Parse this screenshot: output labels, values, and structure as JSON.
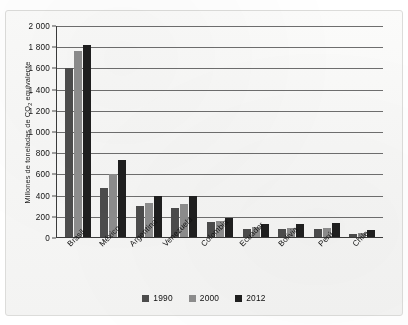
{
  "chart_data": {
    "type": "bar",
    "title": "",
    "subtitle": "",
    "xlabel": "",
    "ylabel": "Millones de toneladas de CO2 equivalente",
    "ylabel_parts": {
      "before": "Millones de toneladas de CO",
      "subscript": "2",
      "after": " equivalente"
    },
    "categories": [
      "Brasil",
      "México",
      "Argentina",
      "Venezuela",
      "Colombia",
      "Ecuador",
      "Bolivia",
      "Perú",
      "Chile"
    ],
    "series": [
      {
        "name": "1990",
        "color": "#4c4c4c",
        "values": [
          1600,
          470,
          300,
          285,
          150,
          85,
          85,
          85,
          35
        ]
      },
      {
        "name": "2000",
        "color": "#8d8d8d",
        "values": [
          1760,
          600,
          335,
          320,
          160,
          105,
          95,
          90,
          45
        ]
      },
      {
        "name": "2012",
        "color": "#1f1f1f",
        "values": [
          1820,
          740,
          395,
          395,
          190,
          130,
          130,
          140,
          75
        ]
      }
    ],
    "ylim": [
      0,
      2000
    ],
    "ytick_step": 200,
    "yticks": [
      0,
      200,
      400,
      600,
      800,
      1000,
      1200,
      1400,
      1600,
      1800,
      2000
    ],
    "ytick_labels": [
      "0",
      "200",
      "400",
      "600",
      "800",
      "1 000",
      "1 200",
      "1 400",
      "1 600",
      "1 800",
      "2 000"
    ],
    "grid": true,
    "grid_axis": "y",
    "legend_position": "bottom",
    "legend_entries": [
      "1990",
      "2000",
      "2012"
    ],
    "annotations": []
  }
}
